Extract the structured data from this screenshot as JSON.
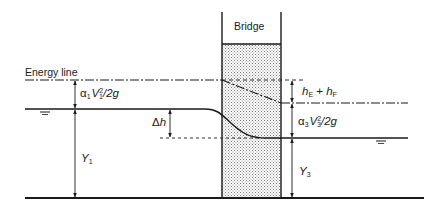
{
  "diagram": {
    "type": "hydraulic-profile",
    "labels": {
      "bridge": "Bridge",
      "energy_line": "Energy line",
      "upstream_velocity_head": {
        "coef": "α",
        "coef_sub": "1",
        "var": "V",
        "var_sub": "1",
        "var_sup": "2",
        "tail": "/2g"
      },
      "head_loss": {
        "a": "h",
        "a_sub": "E",
        "op": " + ",
        "b": "h",
        "b_sub": "F"
      },
      "downstream_velocity_head": {
        "coef": "α",
        "coef_sub": "3",
        "var": "V",
        "var_sub": "3",
        "var_sup": "2",
        "tail": "/2g"
      },
      "drop": {
        "delta": "Δ",
        "var": "h"
      },
      "upstream_depth": {
        "var": "Y",
        "sub": "1"
      },
      "downstream_depth": {
        "var": "Y",
        "sub": "3"
      }
    },
    "colors": {
      "line": "#1a1a1a",
      "stipple": "#9a9a9a",
      "background": "#ffffff"
    }
  }
}
